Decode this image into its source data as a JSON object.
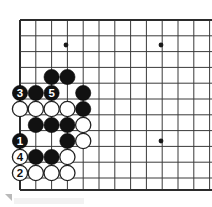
{
  "figure": {
    "board_size": 19,
    "visible_columns": 12,
    "visible_rows": 12,
    "background_color": "#ffffff",
    "line_color": "#3a3a3a",
    "edge_line_color": "#2b2b2b",
    "black_stone_color": "#111111",
    "white_stone_color": "#ffffff",
    "white_stone_border_color": "#222222",
    "grid": {
      "origin_x": 20,
      "origin_y": 20,
      "spacing": 15.8,
      "cols": 12,
      "rows": 11
    },
    "star_points": [
      {
        "col": 3,
        "row": 1.6,
        "x": 66,
        "y": 45
      },
      {
        "col": 9,
        "row": 1.6,
        "x": 161,
        "y": 45
      },
      {
        "col": 9,
        "row": 7.6,
        "x": 161,
        "y": 141
      }
    ],
    "stones": [
      {
        "color": "black",
        "x": 51.6,
        "y": 77,
        "label": ""
      },
      {
        "color": "black",
        "x": 67.4,
        "y": 77,
        "label": ""
      },
      {
        "color": "black",
        "x": 20.0,
        "y": 93,
        "label": "3"
      },
      {
        "color": "black",
        "x": 35.8,
        "y": 93,
        "label": ""
      },
      {
        "color": "black",
        "x": 51.6,
        "y": 93,
        "label": "5"
      },
      {
        "color": "black",
        "x": 83.2,
        "y": 93,
        "label": ""
      },
      {
        "color": "white",
        "x": 20.0,
        "y": 109,
        "label": ""
      },
      {
        "color": "white",
        "x": 35.8,
        "y": 109,
        "label": ""
      },
      {
        "color": "white",
        "x": 51.6,
        "y": 109,
        "label": ""
      },
      {
        "color": "white",
        "x": 67.4,
        "y": 109,
        "label": ""
      },
      {
        "color": "black",
        "x": 83.2,
        "y": 109,
        "label": ""
      },
      {
        "color": "black",
        "x": 35.8,
        "y": 125,
        "label": ""
      },
      {
        "color": "black",
        "x": 51.6,
        "y": 125,
        "label": ""
      },
      {
        "color": "black",
        "x": 67.4,
        "y": 125,
        "label": ""
      },
      {
        "color": "white",
        "x": 83.2,
        "y": 125,
        "label": ""
      },
      {
        "color": "black",
        "x": 20.0,
        "y": 141,
        "label": "1"
      },
      {
        "color": "black",
        "x": 67.4,
        "y": 141,
        "label": ""
      },
      {
        "color": "white",
        "x": 83.2,
        "y": 141,
        "label": ""
      },
      {
        "color": "white",
        "x": 20.0,
        "y": 157,
        "label": "4"
      },
      {
        "color": "black",
        "x": 35.8,
        "y": 157,
        "label": ""
      },
      {
        "color": "black",
        "x": 51.6,
        "y": 157,
        "label": ""
      },
      {
        "color": "white",
        "x": 67.4,
        "y": 157,
        "label": ""
      },
      {
        "color": "white",
        "x": 20.0,
        "y": 173,
        "label": "2"
      },
      {
        "color": "white",
        "x": 35.8,
        "y": 173,
        "label": ""
      },
      {
        "color": "white",
        "x": 51.6,
        "y": 173,
        "label": ""
      },
      {
        "color": "white",
        "x": 67.4,
        "y": 173,
        "label": ""
      }
    ],
    "move_numbers": [
      {
        "number": "1",
        "color": "black",
        "x": 20.0,
        "y": 141
      },
      {
        "number": "2",
        "color": "white",
        "x": 20.0,
        "y": 173
      },
      {
        "number": "3",
        "color": "black",
        "x": 20.0,
        "y": 93
      },
      {
        "number": "4",
        "color": "white",
        "x": 20.0,
        "y": 157
      },
      {
        "number": "5",
        "color": "black",
        "x": 51.6,
        "y": 93
      }
    ]
  }
}
